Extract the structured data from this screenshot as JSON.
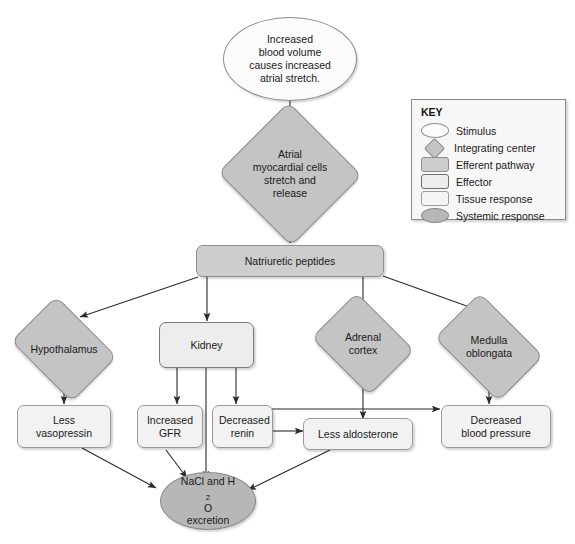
{
  "diagram": {
    "nodes": [
      {
        "id": "stimulus",
        "label": "Increased blood volume causes increased atrial stretch.",
        "type": "Stimulus"
      },
      {
        "id": "atrial_cells",
        "label": "Atrial myocardial cells stretch and release",
        "type": "Integrating center"
      },
      {
        "id": "peptides",
        "label": "Natriuretic peptides",
        "type": "Efferent pathway"
      },
      {
        "id": "hypothalamus",
        "label": "Hypothalamus",
        "type": "Integrating center"
      },
      {
        "id": "kidney",
        "label": "Kidney",
        "type": "Effector"
      },
      {
        "id": "adrenal",
        "label": "Adrenal cortex",
        "type": "Integrating center"
      },
      {
        "id": "medulla",
        "label": "Medulla oblongata",
        "type": "Integrating center"
      },
      {
        "id": "vasopressin",
        "label": "Less vasopressin",
        "type": "Tissue response"
      },
      {
        "id": "gfr",
        "label": "Increased GFR",
        "type": "Tissue response"
      },
      {
        "id": "renin",
        "label": "Decreased renin",
        "type": "Tissue response"
      },
      {
        "id": "aldosterone",
        "label": "Less aldosterone",
        "type": "Tissue response"
      },
      {
        "id": "bp",
        "label": "Decreased blood pressure",
        "type": "Tissue response"
      },
      {
        "id": "excretion",
        "label": "NaCl and H2O excretion",
        "type": "Systemic response"
      }
    ],
    "node_text": {
      "stimulus_line1": "Increased",
      "stimulus_line2": "blood volume",
      "stimulus_line3": "causes increased",
      "stimulus_line4": "atrial stretch.",
      "atrial_line1": "Atrial",
      "atrial_line2": "myocardial cells",
      "atrial_line3": "stretch and",
      "atrial_line4": "release",
      "peptides": "Natriuretic peptides",
      "hypothalamus": "Hypothalamus",
      "kidney": "Kidney",
      "adrenal_line1": "Adrenal",
      "adrenal_line2": "cortex",
      "medulla_line1": "Medulla",
      "medulla_line2": "oblongata",
      "vasopressin_line1": "Less",
      "vasopressin_line2": "vasopressin",
      "gfr_line1": "Increased",
      "gfr_line2": "GFR",
      "renin_line1": "Decreased",
      "renin_line2": "renin",
      "aldosterone": "Less aldosterone",
      "bp_line1": "Decreased",
      "bp_line2": "blood pressure",
      "excretion_pre": "NaCl and H",
      "excretion_sub": "2",
      "excretion_post": "O",
      "excretion_line2": "excretion"
    },
    "edges": [
      {
        "from": "stimulus",
        "to": "atrial_cells"
      },
      {
        "from": "atrial_cells",
        "to": "peptides"
      },
      {
        "from": "peptides",
        "to": "hypothalamus"
      },
      {
        "from": "peptides",
        "to": "kidney"
      },
      {
        "from": "peptides",
        "to": "adrenal"
      },
      {
        "from": "peptides",
        "to": "medulla"
      },
      {
        "from": "hypothalamus",
        "to": "vasopressin"
      },
      {
        "from": "kidney",
        "to": "gfr"
      },
      {
        "from": "kidney",
        "to": "excretion"
      },
      {
        "from": "kidney",
        "to": "renin"
      },
      {
        "from": "adrenal",
        "to": "aldosterone"
      },
      {
        "from": "medulla",
        "to": "bp"
      },
      {
        "from": "renin",
        "to": "aldosterone"
      },
      {
        "from": "renin",
        "to": "bp"
      },
      {
        "from": "vasopressin",
        "to": "excretion"
      },
      {
        "from": "gfr",
        "to": "excretion"
      },
      {
        "from": "aldosterone",
        "to": "excretion"
      }
    ]
  },
  "legend": {
    "title": "KEY",
    "items": [
      {
        "shape": "ellipse-white",
        "label": "Stimulus"
      },
      {
        "shape": "diamond-gray",
        "label": "Integrating center"
      },
      {
        "shape": "rounded-rect-gray",
        "label": "Efferent pathway"
      },
      {
        "shape": "rect-thick-border",
        "label": "Effector"
      },
      {
        "shape": "rounded-rect-white",
        "label": "Tissue response"
      },
      {
        "shape": "ellipse-gray",
        "label": "Systemic response"
      }
    ]
  },
  "colors": {
    "background": "#ffffff",
    "stroke": "#2b2b2b",
    "gray_fill": "#c4c4c4",
    "light_fill": "#ededed",
    "efferent_fill": "#cdcdcd",
    "systemic_fill": "#b7b7b7"
  }
}
